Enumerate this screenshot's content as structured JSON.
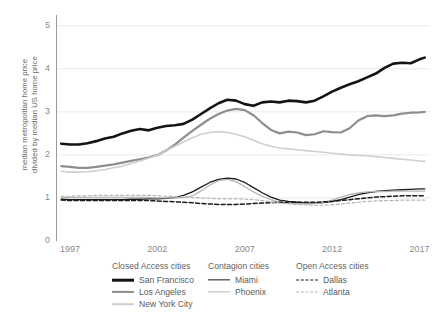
{
  "axes": {
    "ylabel": "median metropolitan home price\ndivided by median US home price",
    "xlabel": "",
    "yticks": [
      "0",
      "1",
      "2",
      "3",
      "4",
      "5"
    ],
    "xticks": [
      "1997",
      "2002",
      "2007",
      "2012",
      "2017"
    ]
  },
  "legend": {
    "groups": [
      {
        "title": "Closed Access cities",
        "items": [
          {
            "label": "San Francisco",
            "color": "#141414",
            "width": 2.6,
            "dash": "none"
          },
          {
            "label": "Los Angeles",
            "color": "#8e8e8e",
            "width": 2.2,
            "dash": "none"
          },
          {
            "label": "New York City",
            "color": "#cfcfcf",
            "width": 1.6,
            "dash": "none"
          }
        ]
      },
      {
        "title": "Contagion cities",
        "items": [
          {
            "label": "Miami",
            "color": "#1a1a1a",
            "width": 1.3,
            "dash": "none"
          },
          {
            "label": "Phoenix",
            "color": "#b5b5b5",
            "width": 1.3,
            "dash": "none"
          }
        ]
      },
      {
        "title": "Open Access cities",
        "items": [
          {
            "label": "Dallas",
            "color": "#1a1a1a",
            "width": 1.5,
            "dash": "4,2.4"
          },
          {
            "label": "Atlanta",
            "color": "#b5b5b5",
            "width": 1.2,
            "dash": "3,2.4"
          }
        ]
      }
    ]
  },
  "chart_data": {
    "type": "line",
    "title": "",
    "xlabel": "",
    "ylabel": "median metropolitan home price divided by median US home price",
    "xlim": [
      1996.2,
      2017.6
    ],
    "ylim": [
      0,
      5.25
    ],
    "xticks": [
      1997,
      2002,
      2007,
      2012,
      2017
    ],
    "yticks": [
      0,
      1,
      2,
      3,
      4,
      5
    ],
    "grid": "horizontal",
    "legend_position": "below",
    "x": [
      1996.5,
      1997,
      1997.5,
      1998,
      1998.5,
      1999,
      1999.5,
      2000,
      2000.5,
      2001,
      2001.5,
      2002,
      2002.5,
      2003,
      2003.5,
      2004,
      2004.5,
      2005,
      2005.5,
      2006,
      2006.5,
      2007,
      2007.5,
      2008,
      2008.5,
      2009,
      2009.5,
      2010,
      2010.5,
      2011,
      2011.5,
      2012,
      2012.5,
      2013,
      2013.5,
      2014,
      2014.5,
      2015,
      2015.5,
      2016,
      2016.5,
      2017,
      2017.3
    ],
    "series": [
      {
        "name": "San Francisco",
        "group": "Closed Access cities",
        "color": "#141414",
        "width": 2.6,
        "dash": "none",
        "values": [
          2.26,
          2.24,
          2.24,
          2.27,
          2.32,
          2.38,
          2.42,
          2.5,
          2.56,
          2.6,
          2.57,
          2.63,
          2.67,
          2.69,
          2.72,
          2.82,
          2.95,
          3.08,
          3.2,
          3.28,
          3.26,
          3.18,
          3.14,
          3.22,
          3.24,
          3.22,
          3.26,
          3.25,
          3.22,
          3.26,
          3.36,
          3.47,
          3.56,
          3.64,
          3.71,
          3.8,
          3.89,
          4.02,
          4.12,
          4.14,
          4.13,
          4.22,
          4.26
        ]
      },
      {
        "name": "Los Angeles",
        "group": "Closed Access cities",
        "color": "#8e8e8e",
        "width": 2.2,
        "dash": "none",
        "values": [
          1.74,
          1.72,
          1.7,
          1.7,
          1.72,
          1.75,
          1.78,
          1.82,
          1.86,
          1.9,
          1.94,
          2.0,
          2.1,
          2.24,
          2.4,
          2.56,
          2.7,
          2.84,
          2.95,
          3.03,
          3.07,
          3.04,
          2.92,
          2.74,
          2.58,
          2.5,
          2.54,
          2.52,
          2.46,
          2.48,
          2.55,
          2.53,
          2.52,
          2.62,
          2.8,
          2.9,
          2.92,
          2.9,
          2.92,
          2.96,
          2.98,
          2.99,
          3.0
        ]
      },
      {
        "name": "New York City",
        "group": "Closed Access cities",
        "color": "#cfcfcf",
        "width": 1.6,
        "dash": "none",
        "values": [
          1.62,
          1.6,
          1.6,
          1.61,
          1.63,
          1.66,
          1.7,
          1.74,
          1.8,
          1.86,
          1.92,
          2.0,
          2.1,
          2.2,
          2.3,
          2.4,
          2.48,
          2.52,
          2.54,
          2.52,
          2.48,
          2.42,
          2.34,
          2.26,
          2.2,
          2.16,
          2.14,
          2.12,
          2.1,
          2.08,
          2.06,
          2.04,
          2.02,
          2.0,
          1.99,
          1.98,
          1.96,
          1.94,
          1.92,
          1.9,
          1.88,
          1.86,
          1.85
        ]
      },
      {
        "name": "Miami",
        "group": "Contagion cities",
        "color": "#1a1a1a",
        "width": 1.3,
        "dash": "none",
        "values": [
          0.97,
          0.96,
          0.96,
          0.96,
          0.96,
          0.96,
          0.96,
          0.96,
          0.97,
          0.97,
          0.98,
          0.98,
          0.99,
          1.01,
          1.06,
          1.14,
          1.25,
          1.36,
          1.43,
          1.46,
          1.44,
          1.36,
          1.24,
          1.12,
          1.02,
          0.95,
          0.92,
          0.9,
          0.88,
          0.88,
          0.89,
          0.92,
          0.96,
          1.02,
          1.08,
          1.12,
          1.15,
          1.17,
          1.18,
          1.19,
          1.2,
          1.21,
          1.21
        ]
      },
      {
        "name": "Phoenix",
        "group": "Contagion cities",
        "color": "#b5b5b5",
        "width": 1.3,
        "dash": "none",
        "values": [
          1.02,
          1.01,
          1.01,
          1.01,
          1.01,
          1.01,
          1.01,
          1.01,
          1.01,
          1.01,
          1.01,
          1.0,
          1.0,
          1.0,
          1.01,
          1.05,
          1.16,
          1.3,
          1.4,
          1.43,
          1.38,
          1.26,
          1.14,
          1.04,
          0.96,
          0.9,
          0.88,
          0.87,
          0.86,
          0.87,
          0.9,
          0.95,
          1.02,
          1.08,
          1.12,
          1.14,
          1.15,
          1.15,
          1.16,
          1.16,
          1.16,
          1.16,
          1.16
        ]
      },
      {
        "name": "Dallas",
        "group": "Open Access cities",
        "color": "#1a1a1a",
        "width": 1.5,
        "dash": "4,2.4",
        "values": [
          0.95,
          0.94,
          0.94,
          0.94,
          0.94,
          0.94,
          0.94,
          0.94,
          0.94,
          0.94,
          0.94,
          0.93,
          0.92,
          0.91,
          0.9,
          0.89,
          0.87,
          0.86,
          0.85,
          0.85,
          0.85,
          0.86,
          0.87,
          0.88,
          0.89,
          0.9,
          0.9,
          0.9,
          0.9,
          0.9,
          0.91,
          0.92,
          0.94,
          0.96,
          0.98,
          1.0,
          1.02,
          1.03,
          1.04,
          1.05,
          1.05,
          1.05,
          1.05
        ]
      },
      {
        "name": "Atlanta",
        "group": "Open Access cities",
        "color": "#b5b5b5",
        "width": 1.2,
        "dash": "3,2.4",
        "values": [
          1.04,
          1.04,
          1.05,
          1.05,
          1.06,
          1.06,
          1.06,
          1.06,
          1.06,
          1.06,
          1.06,
          1.05,
          1.04,
          1.03,
          1.02,
          1.01,
          1.0,
          0.99,
          0.98,
          0.98,
          0.98,
          0.97,
          0.96,
          0.94,
          0.91,
          0.88,
          0.86,
          0.85,
          0.84,
          0.83,
          0.83,
          0.84,
          0.86,
          0.88,
          0.9,
          0.92,
          0.93,
          0.94,
          0.94,
          0.95,
          0.95,
          0.95,
          0.95
        ]
      }
    ]
  }
}
